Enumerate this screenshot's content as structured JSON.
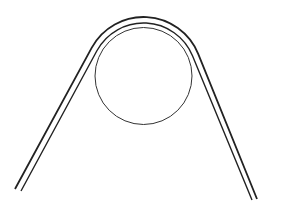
{
  "diagram": {
    "description": "Belt or rope passing over a circular pulley",
    "colors": {
      "background": "#ffffff",
      "stroke": "#222222"
    },
    "pulley": {
      "cx": 143.5,
      "cy": 76,
      "r": 48.5
    },
    "belt": {
      "inner": {
        "r": 53,
        "left_end": [
          21,
          191
        ],
        "right_end": [
          252,
          200
        ]
      },
      "outer": {
        "r": 59,
        "left_end": [
          15,
          189
        ],
        "right_end": [
          257,
          199
        ]
      }
    }
  }
}
